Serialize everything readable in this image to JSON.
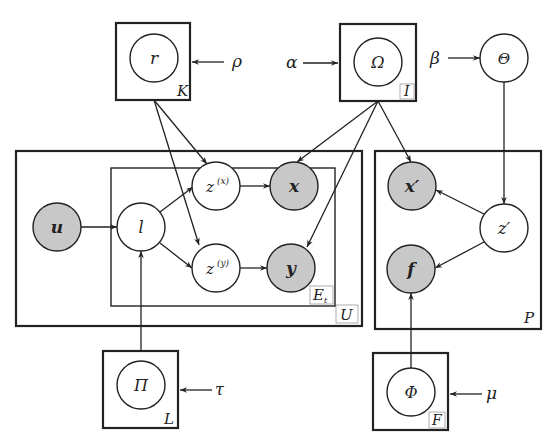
{
  "diagram": {
    "type": "probabilistic-graphical-model (plate notation)",
    "colors": {
      "observed_fill": "#c8c8c8",
      "latent_fill": "#ffffff",
      "stroke": "#222222"
    },
    "plates": {
      "K": "K",
      "I": "I",
      "U": "U",
      "E": "E",
      "E_sub": "t",
      "P": "P",
      "L": "L",
      "F": "F"
    },
    "hyperparameters": {
      "rho": "ρ",
      "alpha": "α",
      "beta": "β",
      "tau": "τ",
      "mu": "μ"
    },
    "nodes": {
      "r": "r",
      "omega": "Ω",
      "theta": "Θ",
      "u": "u",
      "l": "l",
      "zx": "z",
      "zx_sup": "(x)",
      "x": "x",
      "zy": "z",
      "zy_sup": "(y)",
      "y": "y",
      "x_prime": "x′",
      "z_prime": "z′",
      "f": "f",
      "pi": "Π",
      "phi": "Φ"
    },
    "edges": [
      [
        "ρ",
        "K plate"
      ],
      [
        "α",
        "I plate"
      ],
      [
        "β",
        "Θ"
      ],
      [
        "τ",
        "L plate"
      ],
      [
        "μ",
        "F plate"
      ],
      [
        "K plate",
        "z(x)"
      ],
      [
        "K plate",
        "z(y)"
      ],
      [
        "I plate",
        "x"
      ],
      [
        "I plate",
        "y"
      ],
      [
        "I plate",
        "x′"
      ],
      [
        "Θ",
        "z′"
      ],
      [
        "u",
        "l"
      ],
      [
        "l",
        "z(x)"
      ],
      [
        "l",
        "z(y)"
      ],
      [
        "Π",
        "l"
      ],
      [
        "z(x)",
        "x"
      ],
      [
        "z(y)",
        "y"
      ],
      [
        "z′",
        "x′"
      ],
      [
        "z′",
        "f"
      ],
      [
        "Φ",
        "f"
      ]
    ]
  }
}
